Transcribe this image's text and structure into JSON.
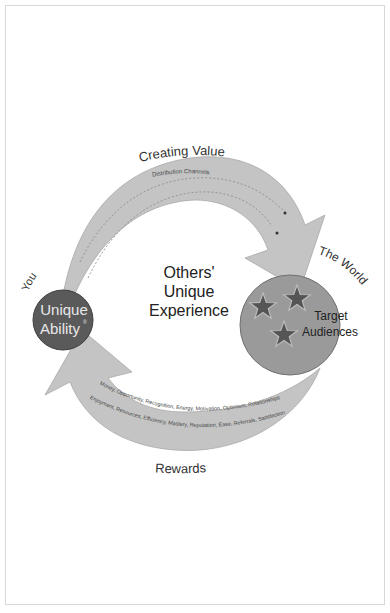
{
  "diagram": {
    "top_arrow": {
      "label": "Creating Value",
      "inner_label": "Distribution Channels"
    },
    "left_node": {
      "outer_label": "You",
      "title_line1": "Unique",
      "title_line2": "Ability",
      "mark": "®",
      "color": "#5a5a5a"
    },
    "right_node": {
      "outer_label": "The World",
      "title_line1": "Target",
      "title_line2": "Audiences",
      "color": "#9a9a9a",
      "star_color": "#555555",
      "star_count": 3
    },
    "center": {
      "line1": "Others'",
      "line2": "Unique",
      "line3": "Experience"
    },
    "bottom_arrow": {
      "label": "Rewards",
      "inner_line1": "Money, Opportunity, Recognition, Energy, Motivation, Optimism, Relationships",
      "inner_line2": "Enjoyment, Resources, Efficiency, Mastery, Reputation, Ease, Referrals, Satisfaction"
    },
    "arrow_color": "#c4c4c4"
  }
}
